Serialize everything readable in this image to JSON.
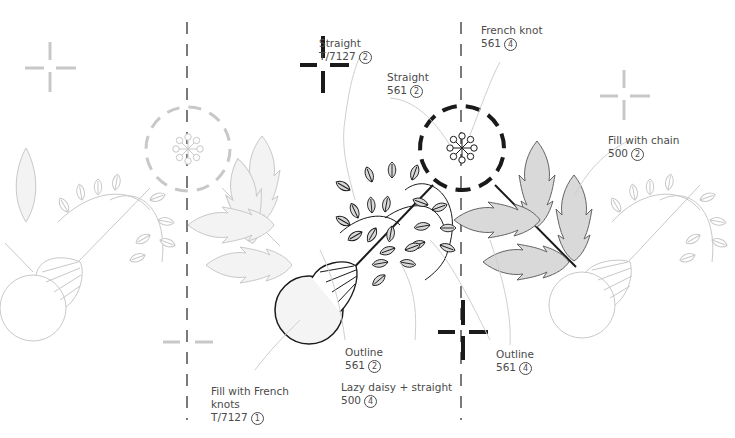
{
  "diagram": {
    "type": "embroidery-pattern",
    "colors": {
      "ink": "#1a1a1a",
      "faded": "#c8c8c8",
      "leaf_fill": "#d9d9d9",
      "label_text": "#4a4a4a",
      "leader_line": "#cfcfcf"
    }
  },
  "labels": [
    {
      "id": "straight-t7127",
      "stitch": "Straight",
      "thread": "T/7127",
      "strands": "2"
    },
    {
      "id": "straight-561",
      "stitch": "Straight",
      "thread": "561",
      "strands": "2"
    },
    {
      "id": "french-knot-561",
      "stitch": "French knot",
      "thread": "561",
      "strands": "4"
    },
    {
      "id": "fill-chain-500",
      "stitch": "Fill with chain",
      "thread": "500",
      "strands": "2"
    },
    {
      "id": "outline-561-2",
      "stitch": "Outline",
      "thread": "561",
      "strands": "2"
    },
    {
      "id": "lazy-daisy-500",
      "stitch": "Lazy daisy + straight",
      "thread": "500",
      "strands": "4"
    },
    {
      "id": "outline-561-4",
      "stitch": "Outline",
      "thread": "561",
      "strands": "4"
    },
    {
      "id": "fill-french-knots",
      "stitch_line1": "Fill with French",
      "stitch_line2": "knots",
      "thread": "T/7127",
      "strands": "1"
    }
  ]
}
